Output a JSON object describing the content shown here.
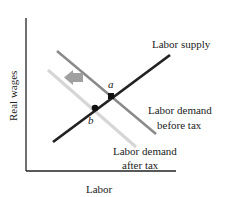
{
  "diagram": {
    "title": "",
    "axes": {
      "ylabel": "Real wages",
      "xlabel": "Labor"
    },
    "curves": {
      "supply": {
        "label": "Labor supply",
        "color": "#222222"
      },
      "demand_before": {
        "label_line1": "Labor demand",
        "label_line2": "before tax",
        "color": "#8a8a8a"
      },
      "demand_after": {
        "label_line1": "Labor demand",
        "label_line2": "after tax",
        "color": "#d6d6d6"
      }
    },
    "points": {
      "a": "a",
      "b": "b"
    },
    "arrow": {
      "direction": "left",
      "color": "#9a9a9a",
      "meaning": "demand-shift-left"
    }
  }
}
